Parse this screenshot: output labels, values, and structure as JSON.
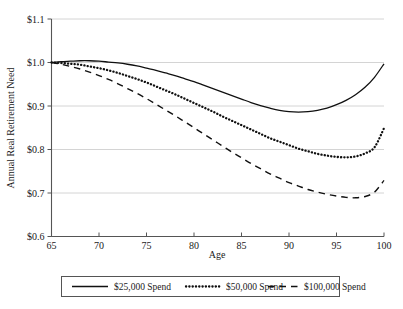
{
  "chart_data": {
    "type": "line",
    "title": "",
    "xlabel": "Age",
    "ylabel": "Annual Real Retirement Need",
    "xlim": [
      65,
      100
    ],
    "ylim": [
      0.6,
      1.1
    ],
    "grid": true,
    "legend_position": "bottom",
    "x_ticks": [
      "65",
      "70",
      "75",
      "80",
      "85",
      "90",
      "95",
      "100"
    ],
    "x_tick_values": [
      65,
      70,
      75,
      80,
      85,
      90,
      95,
      100
    ],
    "y_ticks": [
      "$0.6",
      "$0.7",
      "$0.8",
      "$0.9",
      "$1.0",
      "$1.1"
    ],
    "y_tick_values": [
      0.6,
      0.7,
      0.8,
      0.9,
      1.0,
      1.1
    ],
    "x": [
      65,
      66,
      67,
      68,
      69,
      70,
      71,
      72,
      73,
      74,
      75,
      76,
      77,
      78,
      79,
      80,
      81,
      82,
      83,
      84,
      85,
      86,
      87,
      88,
      89,
      90,
      91,
      92,
      93,
      94,
      95,
      96,
      97,
      98,
      99,
      100
    ],
    "series": [
      {
        "name": "$25,000 Spend",
        "style": "solid",
        "color": "#101010",
        "values": [
          1.0,
          1.002,
          1.003,
          1.004,
          1.004,
          1.003,
          1.001,
          0.999,
          0.996,
          0.992,
          0.987,
          0.982,
          0.976,
          0.97,
          0.963,
          0.956,
          0.948,
          0.94,
          0.932,
          0.924,
          0.916,
          0.908,
          0.901,
          0.895,
          0.89,
          0.887,
          0.886,
          0.887,
          0.89,
          0.895,
          0.903,
          0.913,
          0.926,
          0.943,
          0.966,
          0.997
        ]
      },
      {
        "name": "$50,000 Spend",
        "style": "dotted",
        "color": "#101010",
        "values": [
          1.0,
          0.999,
          0.997,
          0.995,
          0.991,
          0.987,
          0.982,
          0.976,
          0.969,
          0.962,
          0.954,
          0.945,
          0.936,
          0.927,
          0.917,
          0.907,
          0.897,
          0.887,
          0.876,
          0.866,
          0.856,
          0.846,
          0.836,
          0.826,
          0.818,
          0.81,
          0.802,
          0.796,
          0.79,
          0.786,
          0.783,
          0.782,
          0.784,
          0.791,
          0.805,
          0.849
        ]
      },
      {
        "name": "$100,000 Spend",
        "style": "dashed",
        "color": "#101010",
        "values": [
          1.0,
          0.996,
          0.991,
          0.985,
          0.978,
          0.97,
          0.961,
          0.951,
          0.94,
          0.929,
          0.917,
          0.904,
          0.891,
          0.878,
          0.864,
          0.85,
          0.836,
          0.822,
          0.808,
          0.794,
          0.781,
          0.768,
          0.756,
          0.744,
          0.734,
          0.724,
          0.716,
          0.708,
          0.702,
          0.697,
          0.693,
          0.69,
          0.689,
          0.692,
          0.702,
          0.729
        ]
      }
    ]
  },
  "legend": {
    "items": [
      {
        "label": "$25,000 Spend",
        "style": "solid"
      },
      {
        "label": "$50,000 Spend",
        "style": "dotted"
      },
      {
        "label": "$100,000 Spend",
        "style": "dashed"
      }
    ]
  }
}
